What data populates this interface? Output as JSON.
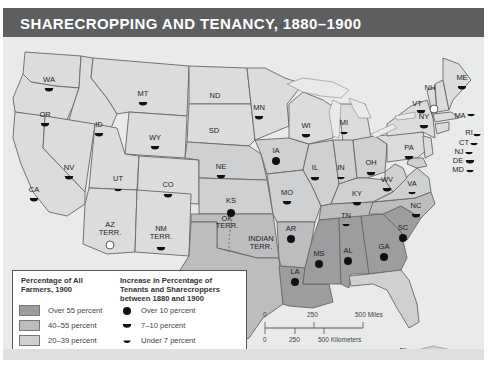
{
  "title": "SHARECROPPING AND TENANCY, 1880–1900",
  "colors": {
    "title_bar": "#5d5e60",
    "over_55": "#9c9d9f",
    "p40_55": "#bcbdbf",
    "p20_39": "#cfd0d1",
    "under_20": "#dcdcdd",
    "water": "#e9eaea",
    "border": "#666666"
  },
  "legend": {
    "shading_heading": "Percentage of All Farmers, 1900",
    "shading_heading_line1": "Percentage of All",
    "shading_heading_line2": "Farmers, 1900",
    "shading": [
      {
        "label": "Over 55 percent",
        "key": "over_55"
      },
      {
        "label": "40–55 percent",
        "key": "p40_55"
      },
      {
        "label": "20–39 percent",
        "key": "p20_39"
      },
      {
        "label": "Under 20 percent",
        "key": "under_20"
      }
    ],
    "symbol_heading_line1": "Increase in Percentage of",
    "symbol_heading_line2": "Tenants and Sharecroppers",
    "symbol_heading_line3": "between 1880 and 1900",
    "symbols": [
      {
        "label": "Over 10 percent",
        "icon": "full-circle"
      },
      {
        "label": "7–10  percent",
        "icon": "half-circle-large"
      },
      {
        "label": "Under 7 percent",
        "icon": "half-circle-small"
      },
      {
        "label": "Decrease",
        "icon": "open-circle"
      }
    ]
  },
  "scale": {
    "miles": [
      "0",
      "250",
      "500 Miles"
    ],
    "kilometers": [
      "0",
      "250",
      "500 Kilometers"
    ]
  },
  "states": [
    {
      "abbr": "WA",
      "shade": "under_20",
      "symbol": "half-large"
    },
    {
      "abbr": "OR",
      "shade": "under_20",
      "symbol": "half-large"
    },
    {
      "abbr": "CA",
      "shade": "under_20",
      "symbol": "half-large"
    },
    {
      "abbr": "ID",
      "shade": "under_20",
      "symbol": "half-large"
    },
    {
      "abbr": "NV",
      "shade": "under_20",
      "symbol": "half-large"
    },
    {
      "abbr": "MT",
      "shade": "under_20",
      "symbol": "half-large"
    },
    {
      "abbr": "WY",
      "shade": "under_20",
      "symbol": "half-large"
    },
    {
      "abbr": "UT",
      "shade": "under_20",
      "symbol": "half-small"
    },
    {
      "abbr": "CO",
      "shade": "under_20",
      "symbol": "half-large"
    },
    {
      "abbr": "AZ TERR.",
      "shade": "under_20",
      "symbol": "decrease"
    },
    {
      "abbr": "NM TERR.",
      "shade": "under_20",
      "symbol": "half-large"
    },
    {
      "abbr": "ND",
      "shade": "under_20",
      "symbol": "none"
    },
    {
      "abbr": "SD",
      "shade": "under_20",
      "symbol": "none"
    },
    {
      "abbr": "NE",
      "shade": "p20_39",
      "symbol": "half-large"
    },
    {
      "abbr": "KS",
      "shade": "p20_39",
      "symbol": "over_10"
    },
    {
      "abbr": "OK TERR.",
      "shade": "p40_55",
      "symbol": "none"
    },
    {
      "abbr": "INDIAN TERR.",
      "shade": "p40_55",
      "symbol": "none"
    },
    {
      "abbr": "TX",
      "shade": "p40_55",
      "symbol": "over_10"
    },
    {
      "abbr": "MN",
      "shade": "under_20",
      "symbol": "half-large"
    },
    {
      "abbr": "IA",
      "shade": "p20_39",
      "symbol": "over_10"
    },
    {
      "abbr": "MO",
      "shade": "p20_39",
      "symbol": "half-large"
    },
    {
      "abbr": "AR",
      "shade": "p40_55",
      "symbol": "over_10"
    },
    {
      "abbr": "LA",
      "shade": "over_55",
      "symbol": "over_10"
    },
    {
      "abbr": "WI",
      "shade": "under_20",
      "symbol": "half-large"
    },
    {
      "abbr": "IL",
      "shade": "p20_39",
      "symbol": "half-large"
    },
    {
      "abbr": "MI",
      "shade": "under_20",
      "symbol": "half-small"
    },
    {
      "abbr": "IN",
      "shade": "p20_39",
      "symbol": "half-small"
    },
    {
      "abbr": "OH",
      "shade": "p20_39",
      "symbol": "half-large"
    },
    {
      "abbr": "KY",
      "shade": "p20_39",
      "symbol": "half-large"
    },
    {
      "abbr": "TN",
      "shade": "p40_55",
      "symbol": "half-small"
    },
    {
      "abbr": "MS",
      "shade": "over_55",
      "symbol": "over_10"
    },
    {
      "abbr": "AL",
      "shade": "over_55",
      "symbol": "over_10"
    },
    {
      "abbr": "GA",
      "shade": "over_55",
      "symbol": "over_10"
    },
    {
      "abbr": "SC",
      "shade": "over_55",
      "symbol": "over_10"
    },
    {
      "abbr": "NC",
      "shade": "p40_55",
      "symbol": "half-large"
    },
    {
      "abbr": "VA",
      "shade": "p20_39",
      "symbol": "half-small"
    },
    {
      "abbr": "WV",
      "shade": "p20_39",
      "symbol": "half-large"
    },
    {
      "abbr": "FL",
      "shade": "p20_39",
      "symbol": "decrease"
    },
    {
      "abbr": "PA",
      "shade": "under_20",
      "symbol": "half-large"
    },
    {
      "abbr": "NY",
      "shade": "under_20",
      "symbol": "half-large"
    },
    {
      "abbr": "VT",
      "shade": "under_20",
      "symbol": "half-large"
    },
    {
      "abbr": "NH",
      "shade": "under_20",
      "symbol": "decrease"
    },
    {
      "abbr": "ME",
      "shade": "under_20",
      "symbol": "half-large"
    },
    {
      "abbr": "MA",
      "shade": "under_20",
      "symbol": "half-small"
    },
    {
      "abbr": "RI",
      "shade": "under_20",
      "symbol": "half-small"
    },
    {
      "abbr": "CT",
      "shade": "under_20",
      "symbol": "half-small"
    },
    {
      "abbr": "NJ",
      "shade": "under_20",
      "symbol": "half-small"
    },
    {
      "abbr": "DE",
      "shade": "p20_39",
      "symbol": "half-large"
    },
    {
      "abbr": "MD",
      "shade": "p20_39",
      "symbol": "half-small"
    }
  ]
}
